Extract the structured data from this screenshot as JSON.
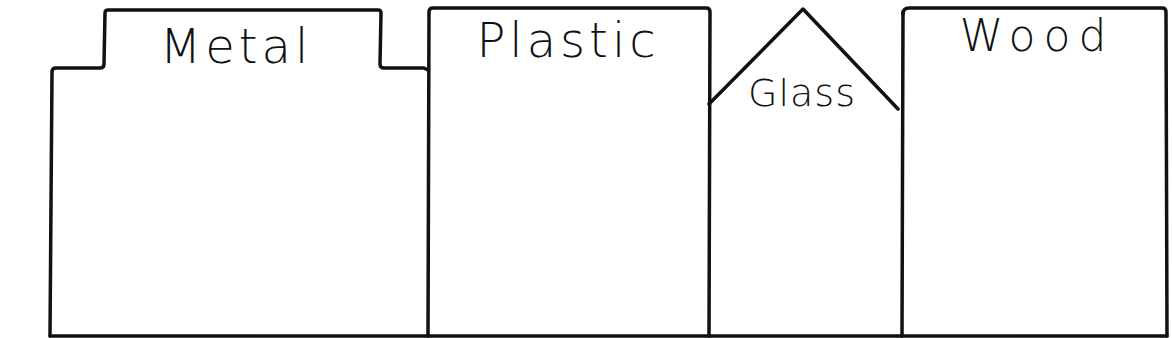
{
  "diagram": {
    "title": "",
    "bins": [
      {
        "id": "metal",
        "label": "Metal",
        "shape": "tabbed-folder"
      },
      {
        "id": "plastic",
        "label": "Plastic",
        "shape": "rectangle"
      },
      {
        "id": "glass",
        "label": "Glass",
        "shape": "house-peak"
      },
      {
        "id": "wood",
        "label": "Wood",
        "shape": "rectangle"
      }
    ],
    "colors": {
      "stroke": "#111111",
      "background": "#ffffff"
    }
  }
}
